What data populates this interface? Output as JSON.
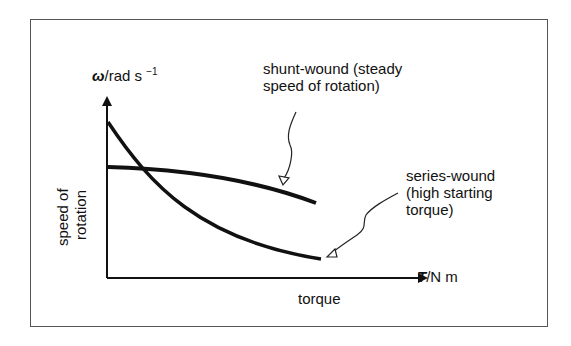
{
  "diagram": {
    "y_axis": {
      "symbol": "ω",
      "unit": "/rad s",
      "unit_exp": "−1",
      "quantity_line1": "speed of",
      "quantity_line2": "rotation"
    },
    "x_axis": {
      "symbol": "T",
      "unit": "/N m",
      "quantity": "torque"
    },
    "curves": [
      {
        "name": "shunt-wound",
        "label_line1": "shunt-wound (steady",
        "label_line2": "speed of rotation)"
      },
      {
        "name": "series-wound",
        "label_line1": "series-wound",
        "label_line2": "(high starting",
        "label_line3": "torque)"
      }
    ]
  }
}
